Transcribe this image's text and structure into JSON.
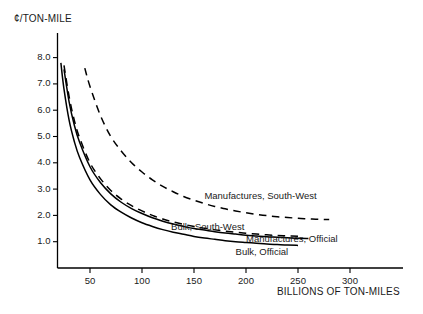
{
  "chart_data": {
    "type": "line",
    "title": "",
    "xlabel": "BILLIONS OF TON-MILES",
    "ylabel": "¢/TON-MILE",
    "xlim": [
      0,
      350
    ],
    "ylim": [
      0,
      8.6
    ],
    "grid": false,
    "legend_position": "inline-right",
    "xticks": [
      50,
      100,
      150,
      200,
      250,
      300
    ],
    "xtick_labels": [
      "50",
      "100",
      "150",
      "200",
      "250",
      "300"
    ],
    "yticks": [
      1.0,
      2.0,
      3.0,
      4.0,
      5.0,
      6.0,
      7.0,
      8.0
    ],
    "ytick_labels": [
      "1.0",
      "2.0",
      "3.0",
      "4.0",
      "5.0",
      "6.0",
      "7.0",
      "8.0"
    ],
    "series": [
      {
        "name": "Manufactures, South-West",
        "style": "dashed",
        "label_anchor_x": 160,
        "label_anchor_y": 2.75,
        "x": [
          40,
          45,
          50,
          60,
          70,
          80,
          90,
          100,
          110,
          120,
          130,
          140,
          150,
          160,
          170,
          180,
          190,
          200,
          210,
          220,
          230,
          240,
          250,
          260,
          270,
          280
        ],
        "y": [
          8.5,
          7.6,
          6.9,
          5.8,
          5.0,
          4.45,
          4.0,
          3.65,
          3.35,
          3.1,
          2.9,
          2.72,
          2.58,
          2.45,
          2.34,
          2.25,
          2.17,
          2.1,
          2.04,
          1.99,
          1.95,
          1.92,
          1.89,
          1.87,
          1.85,
          1.84
        ]
      },
      {
        "name": "Bulk, South-West",
        "style": "dashed",
        "label_anchor_x": 128,
        "label_anchor_y": 1.55,
        "x": [
          22,
          25,
          30,
          35,
          40,
          50,
          60,
          70,
          80,
          90,
          100,
          110,
          120,
          130,
          140,
          150,
          160,
          170,
          180,
          190,
          200,
          210,
          220,
          230,
          240,
          250
        ],
        "y": [
          8.5,
          7.7,
          6.5,
          5.6,
          4.95,
          4.0,
          3.4,
          2.95,
          2.62,
          2.37,
          2.17,
          2.0,
          1.86,
          1.75,
          1.66,
          1.58,
          1.51,
          1.45,
          1.4,
          1.36,
          1.32,
          1.29,
          1.26,
          1.24,
          1.22,
          1.21
        ]
      },
      {
        "name": "Manufactures, Official",
        "style": "solid",
        "label_anchor_x": 200,
        "label_anchor_y": 1.12,
        "x": [
          22,
          25,
          30,
          35,
          40,
          50,
          60,
          70,
          80,
          90,
          100,
          110,
          120,
          130,
          140,
          150,
          160,
          170,
          180,
          190,
          200,
          210,
          220,
          230,
          240,
          250,
          260
        ],
        "y": [
          8.5,
          7.55,
          6.3,
          5.42,
          4.78,
          3.85,
          3.25,
          2.82,
          2.5,
          2.26,
          2.07,
          1.91,
          1.78,
          1.67,
          1.58,
          1.5,
          1.44,
          1.38,
          1.33,
          1.29,
          1.25,
          1.22,
          1.19,
          1.17,
          1.15,
          1.13,
          1.12
        ]
      },
      {
        "name": "Bulk, Official",
        "style": "solid",
        "label_anchor_x": 190,
        "label_anchor_y": 0.62,
        "x": [
          20,
          22,
          25,
          30,
          35,
          40,
          50,
          60,
          70,
          80,
          90,
          100,
          110,
          120,
          130,
          140,
          150,
          160,
          170,
          180,
          190,
          200,
          210,
          220,
          230,
          240,
          250
        ],
        "y": [
          8.5,
          7.8,
          6.8,
          5.6,
          4.8,
          4.2,
          3.35,
          2.8,
          2.4,
          2.12,
          1.9,
          1.72,
          1.58,
          1.46,
          1.36,
          1.28,
          1.2,
          1.14,
          1.09,
          1.04,
          1.0,
          0.97,
          0.94,
          0.91,
          0.89,
          0.87,
          0.86
        ]
      }
    ]
  },
  "labels": {
    "manufactures_south_west": "Manufactures, South-West",
    "bulk_south_west": "Bulk, South-West",
    "manufactures_official": "Manufactures, Official",
    "bulk_official": "Bulk, Official"
  },
  "colors": {
    "line": "#000000",
    "axis": "#000000",
    "text": "#1a1a1a",
    "background": "#ffffff"
  }
}
